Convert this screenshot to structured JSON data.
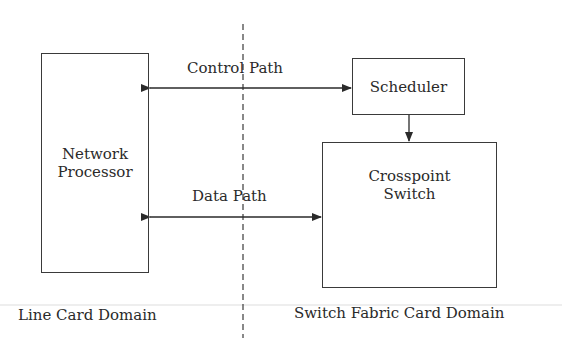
{
  "diagram": {
    "nodes": {
      "network_processor": {
        "line1": "Network",
        "line2": "Processor"
      },
      "scheduler": {
        "label": "Scheduler"
      },
      "crosspoint_switch": {
        "line1": "Crosspoint",
        "line2": "Switch"
      }
    },
    "edges": {
      "control_path": {
        "label": "Control Path",
        "from": "Network Processor",
        "to": "Scheduler",
        "bidirectional": true
      },
      "data_path": {
        "label": "Data Path",
        "from": "Network Processor",
        "to": "Crosspoint Switch",
        "bidirectional": true
      },
      "scheduler_to_switch": {
        "from": "Scheduler",
        "to": "Crosspoint Switch"
      }
    },
    "domains": {
      "left": "Line Card Domain",
      "right": "Switch Fabric Card Domain"
    },
    "colors": {
      "stroke": "#3a3a3a",
      "text": "#2a2a2a",
      "divider": "#dddddd"
    }
  }
}
